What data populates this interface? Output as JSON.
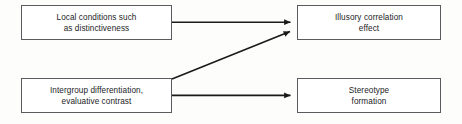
{
  "diagram": {
    "background_color": "#fdfdfc",
    "border_color": "#595b5e",
    "arrow_color": "#1a1a1a",
    "text_color": "#1b1c1e",
    "nodes": [
      {
        "id": "local-conditions",
        "label": "Local conditions such\nas distinctiveness",
        "line1": "Local conditions such",
        "line2": "as distinctiveness"
      },
      {
        "id": "illusory-correlation",
        "label": "Illusory correlation\neffect",
        "line1": "Illusory correlation",
        "line2": "effect"
      },
      {
        "id": "intergroup-differentiation",
        "label": "Intergroup differentiation,\nevaluative contrast",
        "line1": "Intergroup differentiation,",
        "line2": "evaluative contrast"
      },
      {
        "id": "stereotype-formation",
        "label": "Stereotype\nformation",
        "line1": "Stereotype",
        "line2": "formation"
      }
    ],
    "arrows": [
      {
        "id": "arrow-local-to-illusory",
        "from": "local-conditions",
        "to": "illusory-correlation",
        "type": "straight-horizontal"
      },
      {
        "id": "arrow-intergroup-to-illusory",
        "from": "intergroup-differentiation",
        "to": "illusory-correlation",
        "type": "diagonal-up"
      },
      {
        "id": "arrow-intergroup-to-stereotype",
        "from": "intergroup-differentiation",
        "to": "stereotype-formation",
        "type": "straight-horizontal"
      }
    ]
  }
}
